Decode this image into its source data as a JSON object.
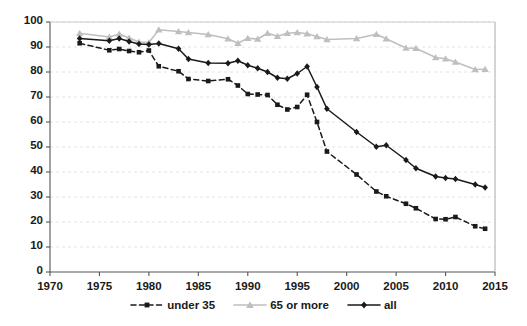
{
  "chart_data": {
    "type": "line",
    "title": "",
    "subtitle": "",
    "xlabel": "",
    "ylabel": "",
    "xlim": [
      1970,
      2015
    ],
    "ylim": [
      0,
      100
    ],
    "grid": true,
    "legend_position": "bottom",
    "y_ticks": [
      0,
      10,
      20,
      30,
      40,
      50,
      60,
      70,
      80,
      90,
      100
    ],
    "x_ticks": [
      1970,
      1975,
      1980,
      1985,
      1990,
      1995,
      2000,
      2005,
      2010,
      2015
    ],
    "y_tick_labels": [
      "0",
      "10",
      "20",
      "30",
      "40",
      "50",
      "60",
      "70",
      "80",
      "90",
      "100"
    ],
    "x_tick_labels": [
      "1970",
      "1975",
      "1980",
      "1985",
      "1990",
      "1995",
      "2000",
      "2005",
      "2010",
      "2015"
    ],
    "series": [
      {
        "name": "under 35",
        "color": "#1a1a1a",
        "marker": "square",
        "line_style": "dashed",
        "x": [
          1973,
          1976,
          1977,
          1978,
          1979,
          1980,
          1981,
          1983,
          1984,
          1986,
          1988,
          1989,
          1990,
          1991,
          1992,
          1993,
          1994,
          1995,
          1996,
          1997,
          1998,
          2001,
          2003,
          2004,
          2006,
          2007,
          2009,
          2010,
          2011,
          2013,
          2014
        ],
        "y": [
          91.5,
          88.7,
          89.2,
          88.4,
          87.9,
          88.6,
          82.3,
          80.3,
          77.2,
          76.4,
          77.1,
          74.6,
          71.2,
          71.0,
          70.8,
          66.9,
          65.0,
          66.0,
          70.9,
          60.0,
          48.2,
          39.0,
          32.2,
          30.3,
          27.3,
          25.5,
          21.2,
          21.1,
          22.0,
          18.3,
          17.3
        ]
      },
      {
        "name": "65 or more",
        "color": "#bfbfbf",
        "marker": "triangle",
        "line_style": "solid",
        "x": [
          1973,
          1976,
          1977,
          1978,
          1979,
          1980,
          1981,
          1983,
          1984,
          1986,
          1988,
          1989,
          1990,
          1991,
          1992,
          1993,
          1994,
          1995,
          1996,
          1997,
          1998,
          2001,
          2003,
          2004,
          2006,
          2007,
          2009,
          2010,
          2011,
          2013,
          2014
        ],
        "y": [
          95.5,
          94.0,
          95.2,
          93.6,
          92.0,
          91.8,
          96.9,
          96.2,
          95.8,
          95.0,
          93.3,
          91.5,
          93.5,
          93.2,
          95.5,
          94.3,
          95.5,
          95.8,
          95.3,
          94.2,
          93.0,
          93.4,
          95.1,
          93.3,
          89.6,
          89.5,
          85.8,
          85.3,
          84.0,
          81.0,
          81.1
        ]
      },
      {
        "name": "all",
        "color": "#1a1a1a",
        "marker": "diamond",
        "line_style": "solid",
        "x": [
          1973,
          1976,
          1977,
          1978,
          1979,
          1980,
          1981,
          1983,
          1984,
          1986,
          1988,
          1989,
          1990,
          1991,
          1992,
          1993,
          1994,
          1995,
          1996,
          1997,
          1998,
          2001,
          2003,
          2004,
          2006,
          2007,
          2009,
          2010,
          2011,
          2013,
          2014
        ],
        "y": [
          93.4,
          92.5,
          93.4,
          92.2,
          91.2,
          91.0,
          91.4,
          89.3,
          85.2,
          83.6,
          83.5,
          84.5,
          82.7,
          81.5,
          80.0,
          77.7,
          77.3,
          79.4,
          82.2,
          74.0,
          65.3,
          56.0,
          50.1,
          50.7,
          44.8,
          41.5,
          38.2,
          37.6,
          37.2,
          35.0,
          33.8
        ]
      }
    ]
  },
  "legend": {
    "items": [
      {
        "label": "under 35",
        "marker_name": "legend-marker-square"
      },
      {
        "label": "65 or more",
        "marker_name": "legend-marker-triangle"
      },
      {
        "label": "all",
        "marker_name": "legend-marker-diamond"
      }
    ]
  }
}
